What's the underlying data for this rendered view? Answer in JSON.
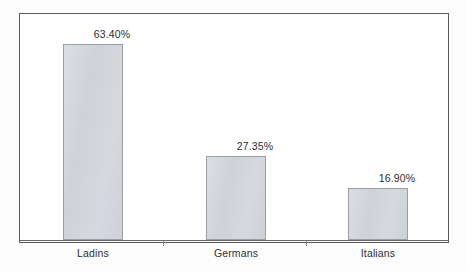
{
  "chart_data": {
    "type": "bar",
    "title": "",
    "subtitle": "",
    "xlabel": "",
    "ylabel": "",
    "categories": [
      "Ladins",
      "Germans",
      "Italians"
    ],
    "values": [
      63.4,
      27.35,
      16.9
    ],
    "value_labels": [
      "63.40%",
      "27.35%",
      "16.90%"
    ],
    "ylim": [
      0,
      69
    ],
    "grid": false,
    "legend": null,
    "axis_tick_labels": [],
    "series": [
      {
        "name": "",
        "values": [
          63.4,
          27.35,
          16.9
        ]
      }
    ],
    "colors": {
      "bar_fill": "#ccd0d6",
      "bar_border": "#9a9ea6",
      "axis": "#6a6a70",
      "frame": "#5a5a60",
      "text": "#2e2e33",
      "background": "#ffffff"
    }
  },
  "chart": {
    "bars": [
      {
        "category": "Ladins",
        "value_label": "63.40%"
      },
      {
        "category": "Germans",
        "value_label": "27.35%"
      },
      {
        "category": "Italians",
        "value_label": "16.90%"
      }
    ]
  }
}
